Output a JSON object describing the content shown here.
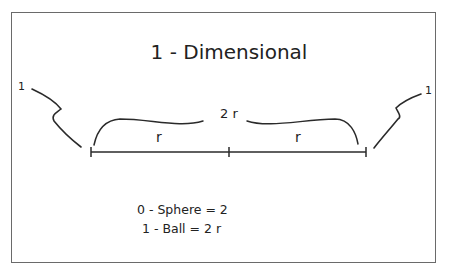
{
  "title": "1 - Dimensional",
  "diagram": {
    "left_endpoint_label": "1",
    "right_endpoint_label": "1",
    "total_length_label": "2 r",
    "left_segment_label": "r",
    "right_segment_label": "r"
  },
  "equations": [
    "0 - Sphere = 2",
    "1 - Ball = 2 r"
  ],
  "colors": {
    "stroke": "#2a2a2a",
    "frame": "#6a6a6a",
    "background": "#ffffff"
  }
}
